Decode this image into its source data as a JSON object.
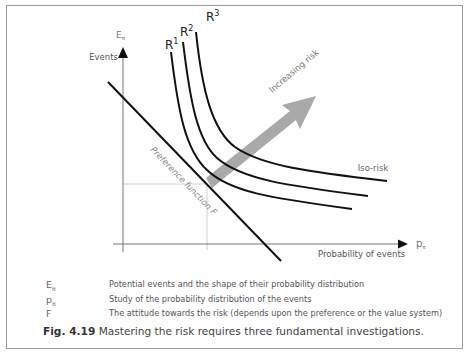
{
  "figure": {
    "number_label": "Fig. 4.19",
    "caption_text": "Mastering the risk requires three fundamental investigations.",
    "colors": {
      "curves": "#111111",
      "arrow": "#a9a9a9",
      "axes": "#666666",
      "guide_lines": "#bbbbbb",
      "label_text": "#666666"
    }
  },
  "diagram": {
    "y_axis": {
      "symbol": "E",
      "subscript": "π",
      "label": "Events"
    },
    "x_axis": {
      "symbol": "p",
      "subscript": "π",
      "label": "Probability of events"
    },
    "curves": [
      {
        "label": "R",
        "sup": "1"
      },
      {
        "label": "R",
        "sup": "2"
      },
      {
        "label": "R",
        "sup": "3"
      }
    ],
    "iso_risk_label": "Iso-risk",
    "arrow_label": "Increasing risk",
    "preference_label": "Preference function F"
  },
  "legend": [
    {
      "symbol": "E",
      "subscript": "π",
      "description": "Potential events and the shape of their probability distribution"
    },
    {
      "symbol": "p",
      "subscript": "π",
      "description": "Study of the probability distribution of the events"
    },
    {
      "symbol": "F",
      "subscript": "",
      "description": "The attitude towards the risk (depends upon the preference or the value system)"
    }
  ]
}
